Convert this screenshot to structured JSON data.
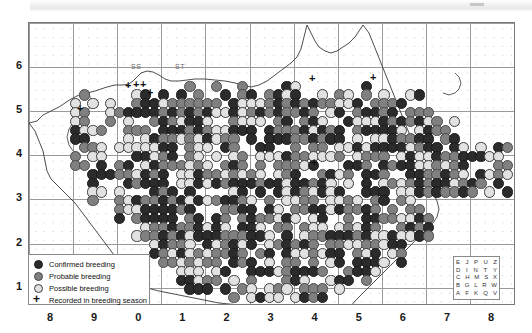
{
  "map": {
    "type": "species-distribution-atlas",
    "projection_note": "British National Grid",
    "square_labels": [
      {
        "text": "SS",
        "x": 130,
        "y": 62
      },
      {
        "text": "ST",
        "x": 174,
        "y": 62
      }
    ]
  },
  "axes": {
    "x_ticks": [
      "8",
      "9",
      "0",
      "1",
      "2",
      "3",
      "4",
      "5",
      "6",
      "7",
      "8"
    ],
    "y_ticks": [
      "6",
      "5",
      "4",
      "3",
      "2",
      "1"
    ]
  },
  "legend": {
    "items": [
      {
        "label": "Confirmed breeding",
        "symbol": "filled-dark-circle",
        "color": "#2b2b2b"
      },
      {
        "label": "Probable breeding",
        "symbol": "filled-grey-circle",
        "color": "#808080"
      },
      {
        "label": "Possible breeding",
        "symbol": "open-light-circle",
        "color": "#e2e2e2"
      },
      {
        "label": "Recorded in breeding season",
        "symbol": "plus-marker",
        "color": "#111111"
      }
    ]
  },
  "letter_key": {
    "rows": [
      [
        "E",
        "J",
        "P",
        "U",
        "Z"
      ],
      [
        "D",
        "I",
        "N",
        "T",
        "Y"
      ],
      [
        "C",
        "H",
        "M",
        "S",
        "X"
      ],
      [
        "B",
        "G",
        "L",
        "R",
        "W"
      ],
      [
        "A",
        "F",
        "K",
        "Q",
        "V"
      ]
    ]
  },
  "chart_data": {
    "type": "scatter",
    "title": "",
    "xlabel": "",
    "ylabel": "",
    "grid": true,
    "categories": [
      "Confirmed breeding",
      "Probable breeding",
      "Possible breeding",
      "Recorded in breeding season"
    ],
    "colors": [
      "#2b2b2b",
      "#808080",
      "#e2e2e2",
      "#111111"
    ]
  }
}
